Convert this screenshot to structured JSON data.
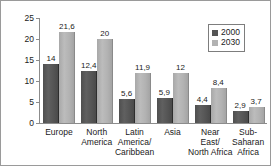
{
  "chart_data": {
    "type": "bar",
    "title": "",
    "xlabel": "",
    "ylabel": "Percent ≥ 65 years",
    "ylim": [
      0,
      25
    ],
    "yticks": [
      "0",
      "5",
      "10",
      "15",
      "20",
      "25"
    ],
    "grid": false,
    "legend_position": "top-right",
    "categories": [
      "Europe",
      "North\nAmerica",
      "Latin\nAmerica/\nCaribbean",
      "Asia",
      "Near\nEast/\nNorth Africa",
      "Sub-Saharan\nAfrica"
    ],
    "series": [
      {
        "name": "2000",
        "color": "#555555",
        "values": [
          14,
          12.4,
          5.6,
          5.9,
          4.4,
          2.9
        ],
        "labels": [
          "14",
          "12,4",
          "5,6",
          "5,9",
          "4,4",
          "2,9"
        ]
      },
      {
        "name": "2030",
        "color": "#b2b2b2",
        "values": [
          21.6,
          20,
          11.9,
          12,
          8.4,
          3.7
        ],
        "labels": [
          "21,6",
          "20",
          "11,9",
          "12",
          "8,4",
          "3,7"
        ]
      }
    ]
  },
  "legend": {
    "entries": [
      {
        "label": "2000"
      },
      {
        "label": "2030"
      }
    ]
  }
}
